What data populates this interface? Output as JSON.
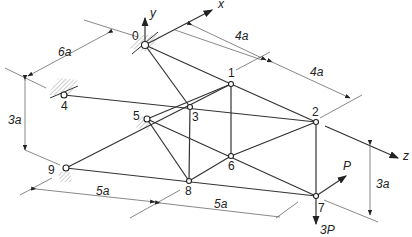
{
  "diagram": {
    "type": "space-truss",
    "nodes": [
      {
        "id": "0",
        "x": 145,
        "y": 45
      },
      {
        "id": "1",
        "x": 231,
        "y": 84
      },
      {
        "id": "2",
        "x": 316,
        "y": 122
      },
      {
        "id": "3",
        "x": 190,
        "y": 107
      },
      {
        "id": "4",
        "x": 64,
        "y": 95
      },
      {
        "id": "5",
        "x": 147,
        "y": 119
      },
      {
        "id": "6",
        "x": 231,
        "y": 156
      },
      {
        "id": "7",
        "x": 316,
        "y": 196
      },
      {
        "id": "8",
        "x": 189,
        "y": 181
      },
      {
        "id": "9",
        "x": 66,
        "y": 168
      }
    ],
    "node_labels": {
      "n0": "0",
      "n1": "1",
      "n2": "2",
      "n3": "3",
      "n4": "4",
      "n5": "5",
      "n6": "6",
      "n7": "7",
      "n8": "8",
      "n9": "9"
    },
    "axes": {
      "x": "x",
      "y": "y",
      "z": "z"
    },
    "dimensions": {
      "d1": "6a",
      "d2": "4a",
      "d3": "4a",
      "d4": "3a",
      "d5": "5a",
      "d6": "5a",
      "d7": "3a"
    },
    "loads": {
      "p": "P",
      "p3": "3P"
    }
  }
}
